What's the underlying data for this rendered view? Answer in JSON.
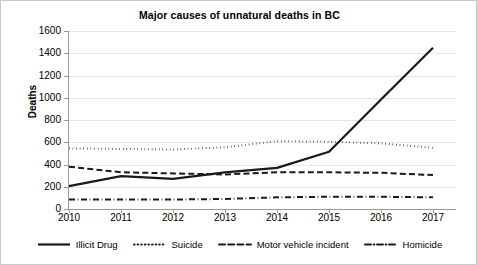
{
  "chart_data": {
    "type": "line",
    "title": "Major causes of unnatural deaths in BC",
    "xlabel": "",
    "ylabel": "Deaths",
    "x": [
      2010,
      2011,
      2012,
      2013,
      2014,
      2015,
      2016,
      2017
    ],
    "categories": [
      "2010",
      "2011",
      "2012",
      "2013",
      "2014",
      "2015",
      "2016",
      "2017"
    ],
    "ylim": [
      0,
      1600
    ],
    "yticks": [
      0,
      200,
      400,
      600,
      800,
      1000,
      1200,
      1400,
      1600
    ],
    "ytick_labels": [
      "0",
      "200",
      "400",
      "600",
      "800",
      "1000",
      "1200",
      "1400",
      "1600"
    ],
    "grid": true,
    "legend_position": "below",
    "series": [
      {
        "name": "Illicit Drug",
        "style": "solid",
        "color": "#1a1a1a",
        "values": [
          205,
          295,
          270,
          330,
          370,
          515,
          985,
          1450
        ]
      },
      {
        "name": "Suicide",
        "style": "dotted",
        "color": "#1a1a1a",
        "values": [
          545,
          540,
          535,
          555,
          610,
          605,
          590,
          550
        ]
      },
      {
        "name": "Motor vehicle incident",
        "style": "dashed",
        "color": "#1a1a1a",
        "values": [
          380,
          330,
          320,
          310,
          330,
          330,
          325,
          305
        ]
      },
      {
        "name": "Homicide",
        "style": "dashdot",
        "color": "#1a1a1a",
        "values": [
          85,
          85,
          85,
          90,
          105,
          110,
          110,
          105
        ]
      }
    ]
  },
  "legend": {
    "items": [
      {
        "label": "Illicit Drug",
        "style": "solid"
      },
      {
        "label": "Suicide",
        "style": "dotted"
      },
      {
        "label": "Motor vehicle incident",
        "style": "dashed"
      },
      {
        "label": "Homicide",
        "style": "dashdot"
      }
    ]
  }
}
